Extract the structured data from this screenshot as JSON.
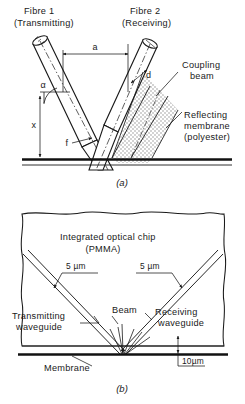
{
  "figure_a": {
    "caption": "(a)",
    "labels": {
      "fibre1_line1": "Fibre 1",
      "fibre1_line2": "(Transmitting)",
      "fibre2_line1": "Fibre 2",
      "fibre2_line2": "(Receiving)",
      "coupling_line1": "Coupling",
      "coupling_line2": "beam",
      "membrane_line1": "Reflecting",
      "membrane_line2": "membrane",
      "membrane_line3": "(polyester)"
    },
    "dimensions": {
      "separation": "a",
      "fibre_diameter": "d",
      "standoff_height": "x",
      "angle": "α",
      "focal": "f"
    }
  },
  "figure_b": {
    "caption": "(b)",
    "labels": {
      "chip_line1": "Integrated optical chip",
      "chip_line2": "(PMMA)",
      "waveguide_width_left": "5 µm",
      "waveguide_width_right": "5 µm",
      "transmitting_line1": "Transmitting",
      "transmitting_line2": "waveguide",
      "receiving_line1": "Receiving",
      "receiving_line2": "waveguide",
      "beam": "Beam",
      "membrane": "Membrane",
      "gap": "10µm"
    }
  },
  "colors": {
    "ink": "#1a1a1a",
    "line": "#222222",
    "stipple": "#b9b9b9",
    "paper": "#ffffff"
  }
}
